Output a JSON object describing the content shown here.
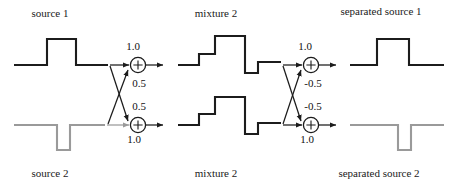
{
  "figure": {
    "colors": {
      "signal_dark": "#1c1c1c",
      "signal_gray": "#9a9a9a",
      "background": "#ffffff"
    }
  },
  "labels": {
    "source_1": "source 1",
    "source_2": "source 2",
    "mixture_top": "mixture 2",
    "mixture_bottom": "mixture 2",
    "separated_source_1": "separated source 1",
    "separated_source_2": "separated source 2"
  },
  "mixing_block": {
    "name": "mixing-stage",
    "node_top": {
      "symbol": "+",
      "direct_gain": "1.0",
      "cross_gain": "0.5"
    },
    "node_bottom": {
      "symbol": "+",
      "cross_gain": "0.5",
      "direct_gain": "1.0"
    }
  },
  "unmixing_block": {
    "name": "unmixing-stage",
    "node_top": {
      "symbol": "+",
      "direct_gain": "1.0",
      "cross_gain": "-0.5"
    },
    "node_bottom": {
      "symbol": "+",
      "cross_gain": "-0.5",
      "direct_gain": "1.0"
    }
  },
  "waveforms": {
    "source_1": {
      "description": "positive rectangular pulse on baseline",
      "color": "#1c1c1c"
    },
    "source_2": {
      "description": "negative rectangular pulse below baseline",
      "color": "#9a9a9a"
    },
    "mixture_top": {
      "description": "step up to mid, up to high, drop below baseline, step back to mid",
      "color": "#1c1c1c"
    },
    "mixture_bottom": {
      "description": "step up to mid, up to high, drop below baseline, step back to mid",
      "color": "#1c1c1c"
    },
    "separated_source_1": {
      "description": "recovered positive rectangular pulse",
      "color": "#1c1c1c"
    },
    "separated_source_2": {
      "description": "recovered negative rectangular pulse",
      "color": "#9a9a9a"
    }
  }
}
